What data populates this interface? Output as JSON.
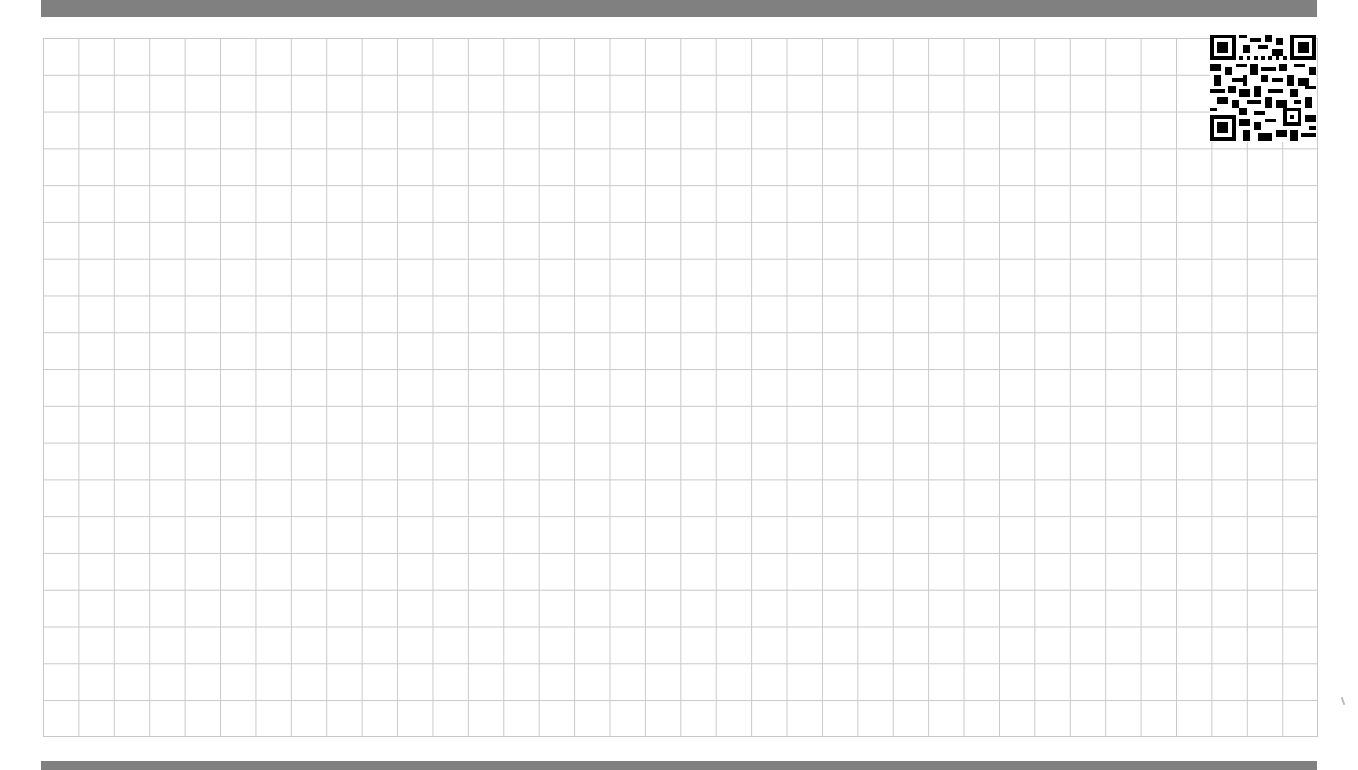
{
  "page": {
    "type": "grid-paper",
    "grid": {
      "columns": 36,
      "rows": 19,
      "line_color": "#c9c9c9"
    },
    "header_bar_color": "#808080",
    "footer_bar_color": "#808080"
  },
  "qr_code": {
    "icon": "qr-code-icon",
    "position": "top-right"
  }
}
